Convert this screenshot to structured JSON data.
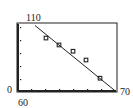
{
  "chart_data": {
    "type": "scatter",
    "title": "",
    "xlabel": "",
    "ylabel": "",
    "xlim": [
      60,
      70
    ],
    "ylim": [
      0,
      110
    ],
    "grid": false,
    "legend": null,
    "tick_labels": {
      "x_min": "60",
      "x_max": "70",
      "y_min": "0",
      "y_max": "110"
    },
    "series": [
      {
        "name": "data",
        "kind": "scatter",
        "marker": "square",
        "x": [
          62.9,
          64.2,
          65.6,
          66.9,
          68.3
        ],
        "y": [
          86,
          75,
          65,
          51,
          22
        ]
      },
      {
        "name": "regression line",
        "kind": "line",
        "x": [
          61.8,
          69.8
        ],
        "y": [
          106,
          2
        ]
      }
    ]
  },
  "labels": {
    "y_max": "110",
    "y_min": "0",
    "x_min": "60",
    "x_max": "70"
  },
  "colors": {
    "ink": "#222222",
    "background": "#ffffff"
  }
}
